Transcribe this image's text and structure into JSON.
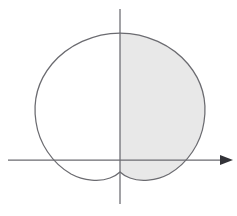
{
  "figure": {
    "title": "",
    "background_color": "#ffffff",
    "width": 237,
    "height": 216,
    "curve_color": "#6b6b70",
    "curve_width": 1.25,
    "axis_color": "#6b6b70",
    "axis_width": 1.25,
    "arrow_color": "#333338",
    "shade_color": "#e8e8e8"
  },
  "chart_data": {
    "type": "line",
    "title": "",
    "subtitle": "",
    "xlabel": "",
    "ylabel": "",
    "grid": false,
    "legend": null,
    "annotations": [],
    "tick_labels_x": [],
    "tick_labels_y": [],
    "axes": {
      "x_axis": {
        "orientation": "horizontal",
        "pixel_y": 160,
        "pixel_x_start": 8,
        "pixel_x_end": 233,
        "arrowhead": "right",
        "arrowhead_tip_x": 233,
        "arrowhead_length": 13,
        "arrowhead_half_width": 5
      },
      "y_axis": {
        "orientation": "vertical",
        "pixel_x": 120,
        "pixel_y_start": 9,
        "pixel_y_end": 204,
        "arrowhead": "none"
      }
    },
    "curve": {
      "name": "cardioid",
      "equation": "r = a(1 - sin(theta))",
      "closed": true,
      "center_x": 120,
      "center_y": 105,
      "cusp_point": [
        120,
        172
      ],
      "top_point": [
        120,
        33
      ],
      "leftmost_point": [
        36,
        105
      ],
      "rightmost_point": [
        205,
        110
      ],
      "lobe_bottom_left": [
        85,
        180
      ],
      "lobe_bottom_right": [
        155,
        180
      ],
      "x_axis_crossings": [
        50,
        190
      ],
      "path": "M 120 33 C 146 33 172 45 188 64 C 203 82 207 103 204 122 C 201 143 188 163 169 174 C 156 181 140 182 130 178 C 125 176 122 174 120 172 C 118 174 115 176 110 178 C 100 182 84 181 71 174 C 52 163 39 143 36 122 C 33 103 37 82 52 64 C 68 45 94 33 120 33 Z"
    },
    "shaded_region": {
      "label": "region right of y-axis enclosed by curve",
      "fill_color": "#e8e8e8",
      "x_range_pixels": [
        120,
        205
      ],
      "path": "M 120 33 C 146 33 172 45 188 64 C 203 82 207 103 204 122 C 201 143 188 163 169 174 C 156 181 140 182 130 178 C 125 176 122 174 120 172 Z"
    }
  }
}
